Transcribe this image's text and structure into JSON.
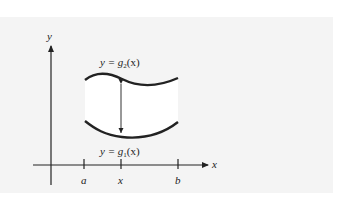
{
  "diagram": {
    "axes": {
      "x_label": "x",
      "y_label": "y"
    },
    "ticks": [
      {
        "name": "a",
        "label": "a"
      },
      {
        "name": "x",
        "label": "x"
      },
      {
        "name": "b",
        "label": "b"
      }
    ],
    "curves": {
      "upper": {
        "label_prefix": "y = ",
        "func": "g",
        "sub": "2",
        "arg": "(x)"
      },
      "lower": {
        "label_prefix": "y = ",
        "func": "g",
        "sub": "1",
        "arg": "(x)"
      }
    },
    "colors": {
      "stroke": "#222222",
      "region_fill": "#ffffff",
      "panel": "#f4f4f4"
    }
  }
}
